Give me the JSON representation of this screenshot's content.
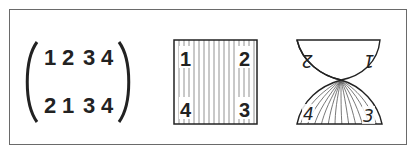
{
  "figure": {
    "matrix": {
      "top_row": [
        "1",
        "2",
        "3",
        "4"
      ],
      "bottom_row": [
        "2",
        "1",
        "3",
        "4"
      ]
    },
    "square": {
      "labels": {
        "top_left": "1",
        "top_right": "2",
        "bottom_left": "4",
        "bottom_right": "3"
      },
      "hatch": "vertical-lines"
    },
    "twisted_shape": {
      "top_labels": {
        "left": "2",
        "right": "1"
      },
      "top_labels_orientation": "upside-down",
      "bottom_labels": {
        "left": "4",
        "right": "3"
      },
      "hatch": "curved-lines"
    },
    "colors": {
      "line": "#222222",
      "hatch": "#555555",
      "frame": "#6a6a6a",
      "background": "#ffffff"
    }
  }
}
